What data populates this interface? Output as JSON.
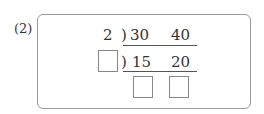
{
  "problem": {
    "label": "(2)",
    "row1": {
      "divisor": "2",
      "paren": ")",
      "a": "30",
      "b": "40"
    },
    "row2": {
      "divisor_blank": "",
      "paren": ")",
      "a": "15",
      "b": "20"
    },
    "row3": {
      "blank_a": "",
      "blank_b": ""
    }
  }
}
